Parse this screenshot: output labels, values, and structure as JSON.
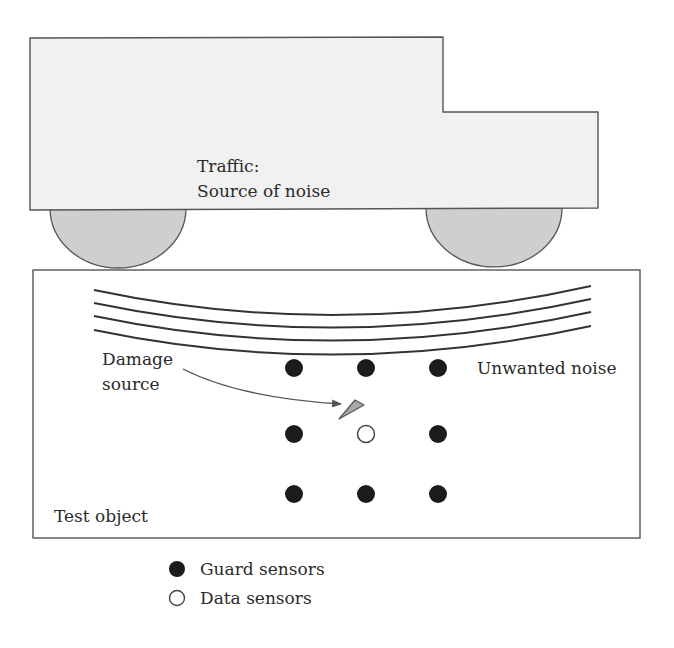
{
  "diagram": {
    "truck": {
      "label_line1": "Traffic:",
      "label_line2": "Source of noise",
      "body_fill": "#f1f1f1",
      "wheel_fill": "#cfcfcf",
      "stroke": "#555555"
    },
    "test_object": {
      "label": "Test object",
      "stroke": "#555555"
    },
    "noise": {
      "label": "Unwanted noise",
      "wave_count": 4
    },
    "damage": {
      "label_line1": "Damage",
      "label_line2": "source",
      "crack_fill": "#a9a9a9"
    },
    "sensors": {
      "grid": [
        [
          "guard",
          "guard",
          "guard"
        ],
        [
          "guard",
          "data",
          "guard"
        ],
        [
          "guard",
          "guard",
          "guard"
        ]
      ],
      "guard_color": "#1c1c1c",
      "data_stroke": "#444444"
    },
    "legend": {
      "items": [
        {
          "symbol": "filled-circle",
          "label": "Guard sensors"
        },
        {
          "symbol": "open-circle",
          "label": "Data sensors"
        }
      ]
    }
  }
}
